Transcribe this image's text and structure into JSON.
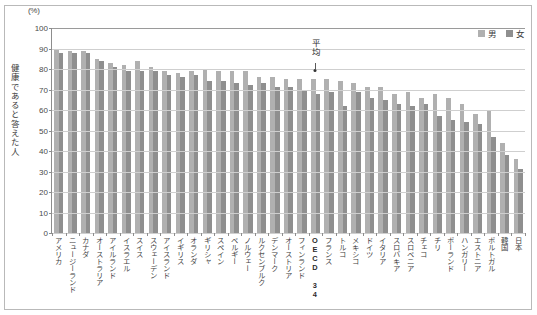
{
  "chart_data": {
    "type": "bar",
    "title": "",
    "subtitle": "",
    "xlabel": "",
    "ylabel": "健康であると答えた人",
    "unit_label": "(%)",
    "ylim": [
      0,
      100
    ],
    "ytick_step": 10,
    "yticks": [
      "0",
      "10",
      "20",
      "30",
      "40",
      "50",
      "60",
      "70",
      "80",
      "90",
      "100"
    ],
    "grid": true,
    "legend_position": "top-right",
    "categories": [
      "アメリカ",
      "ニュージーランド",
      "カナダ",
      "オーストラリア",
      "アイルランド",
      "イスラエル",
      "スイス",
      "スウェーデン",
      "アイスランド",
      "イギリス",
      "オランダ",
      "ギリシャ",
      "スペイン",
      "ベルギー",
      "ノルウェー",
      "ルクセンブルク",
      "デンマーク",
      "オーストリア",
      "フィンランド",
      "OECD 34",
      "フランス",
      "トルコ",
      "メキシコ",
      "ドイツ",
      "イタリア",
      "スロバキア",
      "スロベニア",
      "チェコ",
      "チリ",
      "ポーランド",
      "ハンガリー",
      "エストニア",
      "ポルトガル",
      "韓国",
      "日本"
    ],
    "series": [
      {
        "name": "男",
        "color": "#b0b0b0",
        "values": [
          90,
          89,
          89,
          85,
          83,
          82,
          84,
          81,
          79,
          78,
          79,
          80,
          79,
          79,
          79,
          76,
          76,
          75,
          75,
          75,
          75,
          74,
          73,
          71,
          71,
          68,
          69,
          66,
          68,
          66,
          63,
          58,
          60,
          44,
          36
        ]
      },
      {
        "name": "女",
        "color": "#8f8f8f",
        "values": [
          88,
          88,
          88,
          84,
          81,
          79,
          79,
          79,
          77,
          76,
          77,
          74,
          74,
          73,
          72,
          73,
          71,
          71,
          70,
          68,
          69,
          62,
          69,
          66,
          65,
          63,
          62,
          63,
          57,
          55,
          54,
          53,
          47,
          38,
          31
        ]
      }
    ],
    "annotation": {
      "label": "平均",
      "target_category": "OECD 34"
    }
  },
  "legend": {
    "items": [
      {
        "label": "男",
        "color": "#b0b0b0"
      },
      {
        "label": "女",
        "color": "#8f8f8f"
      }
    ]
  }
}
